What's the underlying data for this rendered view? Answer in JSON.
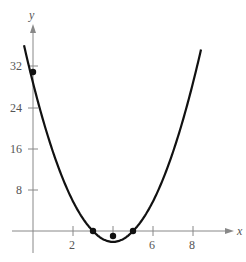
{
  "chart_data": {
    "type": "line",
    "title": "",
    "xlabel": "x",
    "ylabel": "y",
    "x_ticks": [
      2,
      4,
      6,
      8
    ],
    "x_tick_labels": [
      "2",
      "",
      "6",
      "8"
    ],
    "y_ticks": [
      8,
      16,
      24,
      32
    ],
    "y_tick_labels": [
      "8",
      "16",
      "24",
      "32"
    ],
    "xlim": [
      -1,
      10
    ],
    "ylim": [
      -4,
      40
    ],
    "grid": false,
    "series": [
      {
        "name": "y = 2x^2 - 16x + 30",
        "x": [
          -0.5,
          0,
          1,
          2,
          3,
          4,
          5,
          6,
          7,
          8,
          8.4
        ],
        "values": [
          38.5,
          30,
          16,
          6,
          0,
          -2,
          0,
          6,
          16,
          30,
          38.7
        ]
      }
    ],
    "points": [
      {
        "x": 0,
        "y": 30
      },
      {
        "x": 3,
        "y": 0
      },
      {
        "x": 4,
        "y": -2
      },
      {
        "x": 5,
        "y": 0
      }
    ]
  },
  "labels": {
    "x": "x",
    "y": "y",
    "t2": "2",
    "t6": "6",
    "t8": "8",
    "y8": "8",
    "y16": "16",
    "y24": "24",
    "y32": "32"
  }
}
